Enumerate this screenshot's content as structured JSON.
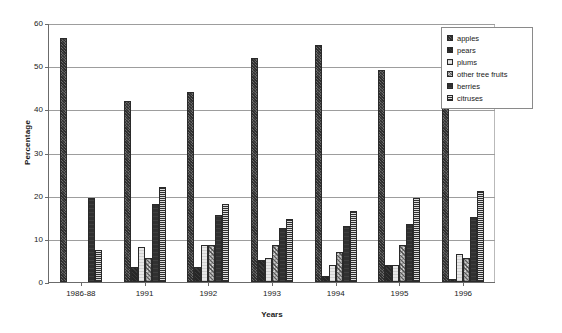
{
  "chart_data": {
    "type": "bar",
    "title": "",
    "xlabel": "Years",
    "ylabel": "Percentage",
    "ylim": [
      0,
      60
    ],
    "yticks": [
      0,
      10,
      20,
      30,
      40,
      50,
      60
    ],
    "grid": true,
    "legend_position": "top-right",
    "categories": [
      "1986-88",
      "1991",
      "1992",
      "1993",
      "1994",
      "1995",
      "1996"
    ],
    "series": [
      {
        "name": "apples",
        "values": [
          56.5,
          42.0,
          44.0,
          52.0,
          55.0,
          49.0,
          47.5
        ]
      },
      {
        "name": "pears",
        "values": [
          0,
          3.5,
          3.5,
          5.0,
          1.5,
          4.0,
          0.8
        ]
      },
      {
        "name": "plums",
        "values": [
          0,
          8.0,
          8.5,
          5.5,
          4.0,
          4.0,
          6.5
        ]
      },
      {
        "name": "other tree fruits",
        "values": [
          0,
          5.5,
          8.5,
          8.5,
          7.0,
          8.5,
          5.5
        ]
      },
      {
        "name": "berries",
        "values": [
          19.5,
          18.0,
          15.5,
          12.5,
          13.0,
          13.5,
          15.0
        ]
      },
      {
        "name": "citruses",
        "values": [
          7.5,
          22.0,
          18.0,
          14.5,
          16.5,
          19.5,
          21.0
        ]
      }
    ]
  },
  "legend": {
    "items": [
      {
        "label": "apples"
      },
      {
        "label": "pears"
      },
      {
        "label": "plums"
      },
      {
        "label": "other tree fruits"
      },
      {
        "label": "berries"
      },
      {
        "label": "citruses"
      }
    ]
  }
}
